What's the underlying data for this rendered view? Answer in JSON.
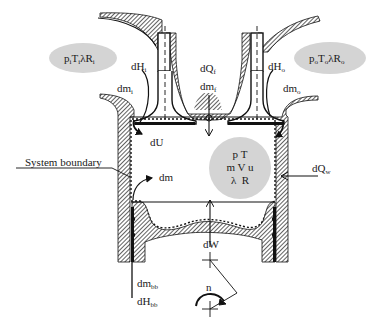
{
  "figure": {
    "colors": {
      "hatch": "#3a3a3a",
      "stroke": "#111111",
      "ellipse_fill": "#d4d4d4",
      "background": "#ffffff"
    }
  },
  "inlet": {
    "state_label": {
      "p": "p",
      "p_sub": "i",
      "T": "T",
      "T_sub": "i",
      "lambda": "λ",
      "R": "R",
      "R_sub": "i"
    },
    "enthalpy": {
      "main": "dH",
      "sub": "i"
    },
    "mass": {
      "main": "dm",
      "sub": "i"
    }
  },
  "outlet": {
    "state_label": {
      "p": "p",
      "p_sub": "o",
      "T": "T",
      "T_sub": "o",
      "lambda": "λ",
      "R": "R",
      "R_sub": "o"
    },
    "enthalpy": {
      "main": "dH",
      "sub": "o"
    },
    "mass": {
      "main": "dm",
      "sub": "o"
    }
  },
  "fuel": {
    "heat": {
      "main": "dQ",
      "sub": "f"
    },
    "mass": {
      "main": "dm",
      "sub": "f"
    }
  },
  "cylinder": {
    "internal_energy": "dU",
    "mass_change": "dm",
    "state": {
      "row1": "p T",
      "row2": "m V u",
      "row3": "λ  R"
    },
    "wall_heat": {
      "main": "dQ",
      "sub": "w"
    },
    "work": "dW",
    "system_boundary_label": "System boundary"
  },
  "blowby": {
    "mass": {
      "main": "dm",
      "sub": "bb"
    },
    "enthalpy": {
      "main": "dH",
      "sub": "bb"
    }
  },
  "crank": {
    "speed_label": "n"
  }
}
